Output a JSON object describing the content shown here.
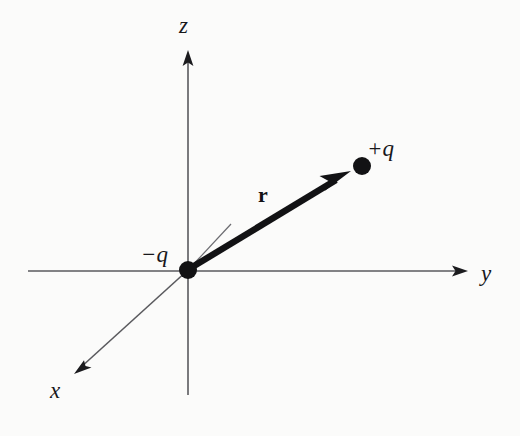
{
  "figure": {
    "background_color": "#fbfbfa",
    "ink_color": "#17171a"
  },
  "axes": {
    "z": {
      "label": "z",
      "direction": "up",
      "tip": [
        188,
        50
      ],
      "tail": [
        188,
        395
      ]
    },
    "y": {
      "label": "y",
      "direction": "right",
      "tip": [
        468,
        271
      ],
      "tail": [
        28,
        271
      ]
    },
    "x": {
      "label": "x",
      "direction": "down-left",
      "tip": [
        74,
        374
      ],
      "tail": [
        188,
        270
      ]
    }
  },
  "charges": {
    "negative": {
      "label": "−q",
      "sign": "-",
      "position": [
        188,
        270
      ]
    },
    "positive": {
      "label": "+q",
      "sign": "+",
      "position": [
        362,
        166
      ]
    }
  },
  "vector": {
    "label": "r",
    "name": "displacement-vector",
    "from": [
      188,
      270
    ],
    "to": [
      351,
      171
    ]
  },
  "guide_line": {
    "name": "projection-guide-line",
    "from": [
      190,
      268
    ],
    "to": [
      231,
      224
    ]
  },
  "icons": {
    "arrowhead": "arrowhead-icon",
    "charge_dot": "charge-dot-icon"
  },
  "colors": {
    "axis": "#5a5a5e",
    "vector": "#121214",
    "dot": "#121214"
  }
}
